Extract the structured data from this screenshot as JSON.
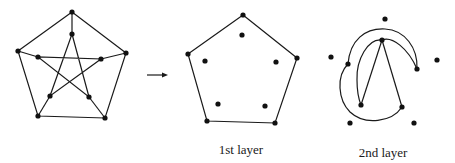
{
  "figure": {
    "line_color": "#1a1a1a",
    "vertex_color": "#111111",
    "arrow": {
      "from": [
        147,
        75
      ],
      "to": [
        168,
        75
      ]
    },
    "panels": [
      {
        "id": "original",
        "caption": "",
        "outer_vertices": [
          [
            72,
            12
          ],
          [
            126,
            53
          ],
          [
            105,
            118
          ],
          [
            38,
            116
          ],
          [
            18,
            51
          ]
        ],
        "inner_vertices": [
          [
            72,
            34
          ],
          [
            101,
            59
          ],
          [
            89,
            97
          ],
          [
            50,
            96
          ],
          [
            38,
            57
          ]
        ]
      },
      {
        "id": "layer1",
        "caption": "1st layer",
        "caption_pos": [
          241,
          150
        ],
        "outer_vertices": [
          [
            243,
            15
          ],
          [
            297,
            58
          ],
          [
            275,
            123
          ],
          [
            207,
            121
          ],
          [
            188,
            54
          ]
        ],
        "inner_vertices": [
          [
            242,
            35
          ],
          [
            276,
            62
          ],
          [
            265,
            106
          ],
          [
            218,
            104
          ],
          [
            205,
            61
          ]
        ]
      },
      {
        "id": "layer2",
        "caption": "2nd layer",
        "caption_pos": [
          383,
          153
        ],
        "outer_vertices": [
          [
            385,
            19
          ],
          [
            437,
            60
          ],
          [
            414,
            123
          ],
          [
            350,
            123
          ],
          [
            331,
            57
          ]
        ],
        "inner_vertices": [
          [
            382,
            40
          ],
          [
            417,
            69
          ],
          [
            402,
            107
          ],
          [
            361,
            105
          ],
          [
            348,
            64
          ]
        ]
      }
    ]
  }
}
